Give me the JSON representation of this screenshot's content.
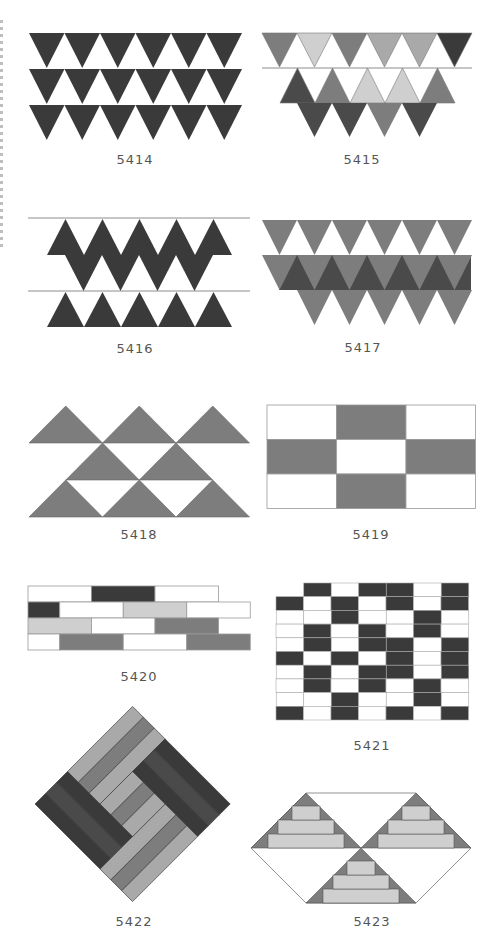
{
  "page": {
    "colors": {
      "black": "#3a3a3a",
      "dark": "#4a4a4a",
      "mid": "#7d7d7d",
      "light": "#a9a9a9",
      "pale": "#cfcfcf",
      "line": "#8c8c8c",
      "caption": "#555555"
    }
  },
  "patterns": [
    {
      "id": "p5414",
      "label": "5414",
      "desc": "Three rows of dark inverted triangles on white"
    },
    {
      "id": "p5415",
      "label": "5415",
      "desc": "Gray-toned triangle bands with guide line"
    },
    {
      "id": "p5416",
      "label": "5416",
      "desc": "Dark diamond zig-zag band between guide lines"
    },
    {
      "id": "p5417",
      "label": "5417",
      "desc": "Gray inverted triangles over dark triangle band"
    },
    {
      "id": "p5418",
      "label": "5418",
      "desc": "Gray half-square triangles with white voids"
    },
    {
      "id": "p5419",
      "label": "5419",
      "desc": "3x3 checker of white and gray rectangles"
    },
    {
      "id": "p5420",
      "label": "5420",
      "desc": "Running-bond bricks in four tones"
    },
    {
      "id": "p5421",
      "label": "5421",
      "desc": "Brick diamond pattern in black and white"
    },
    {
      "id": "p5422",
      "label": "5422",
      "desc": "Interwoven herringbone plank squares"
    },
    {
      "id": "p5423",
      "label": "5423",
      "desc": "Stepped pyramid triangles in hexagon outline"
    }
  ]
}
